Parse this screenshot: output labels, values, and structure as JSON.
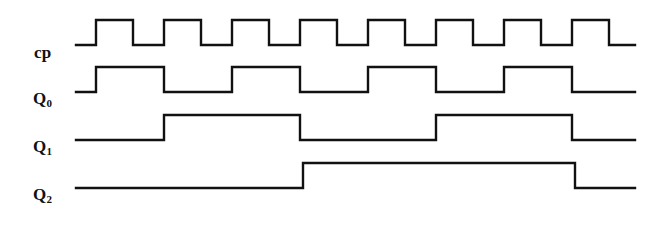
{
  "figure": {
    "type": "timing-diagram",
    "title": "",
    "background_color": "#ffffff",
    "trace_color": "#111111",
    "trace_width": 2.4
  },
  "signals": [
    {
      "name": "cp",
      "label": "cp",
      "subscript": "",
      "row": 0,
      "low_y": 45,
      "high_y": 20,
      "description": "clock pulse input"
    },
    {
      "name": "Q0",
      "label": "Q",
      "subscript": "0",
      "row": 1,
      "low_y": 92,
      "high_y": 67,
      "description": "flip-flop output bit 0"
    },
    {
      "name": "Q1",
      "label": "Q",
      "subscript": "1",
      "row": 2,
      "low_y": 140,
      "high_y": 115,
      "description": "flip-flop output bit 1"
    },
    {
      "name": "Q2",
      "label": "Q",
      "subscript": "2",
      "row": 3,
      "low_y": 188,
      "high_y": 163,
      "description": "flip-flop output bit 2"
    }
  ],
  "chart_data": {
    "type": "line",
    "xlabel": "",
    "ylabel": "",
    "x_start": 76,
    "x_end": 635,
    "clock_first_rise": 96,
    "clock_period": 68,
    "clock_high_width": 37,
    "clock_pulses": 8,
    "series": [
      {
        "name": "cp",
        "initial_level": 0,
        "transitions": [
          {
            "x": 96,
            "level": 1
          },
          {
            "x": 133,
            "level": 0
          },
          {
            "x": 164,
            "level": 1
          },
          {
            "x": 201,
            "level": 0
          },
          {
            "x": 232,
            "level": 1
          },
          {
            "x": 269,
            "level": 0
          },
          {
            "x": 300,
            "level": 1
          },
          {
            "x": 337,
            "level": 0
          },
          {
            "x": 368,
            "level": 1
          },
          {
            "x": 405,
            "level": 0
          },
          {
            "x": 436,
            "level": 1
          },
          {
            "x": 473,
            "level": 0
          },
          {
            "x": 504,
            "level": 1
          },
          {
            "x": 541,
            "level": 0
          },
          {
            "x": 572,
            "level": 1
          },
          {
            "x": 609,
            "level": 0
          }
        ]
      },
      {
        "name": "Q0",
        "initial_level": 0,
        "transitions": [
          {
            "x": 96,
            "level": 1
          },
          {
            "x": 164,
            "level": 0
          },
          {
            "x": 232,
            "level": 1
          },
          {
            "x": 300,
            "level": 0
          },
          {
            "x": 368,
            "level": 1
          },
          {
            "x": 436,
            "level": 0
          },
          {
            "x": 504,
            "level": 1
          },
          {
            "x": 572,
            "level": 0
          }
        ]
      },
      {
        "name": "Q1",
        "initial_level": 0,
        "transitions": [
          {
            "x": 164,
            "level": 1
          },
          {
            "x": 300,
            "level": 0
          },
          {
            "x": 436,
            "level": 1
          },
          {
            "x": 572,
            "level": 0
          }
        ]
      },
      {
        "name": "Q2",
        "initial_level": 0,
        "transitions": [
          {
            "x": 303,
            "level": 1
          },
          {
            "x": 575,
            "level": 0
          }
        ]
      }
    ],
    "grid": false,
    "legend": "none"
  }
}
